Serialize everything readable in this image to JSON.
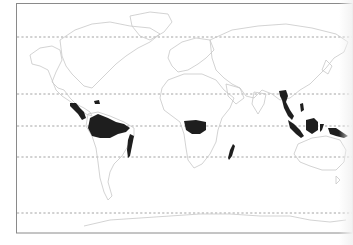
{
  "map": {
    "type": "world-outline",
    "projection": "equirectangular-like",
    "subject": "tropical rainforest distribution",
    "frame": {
      "x": 16,
      "y": 3,
      "width": 336,
      "height": 230,
      "stroke": "#8a8a8a"
    },
    "latitude_lines": [
      {
        "name": "arctic-circle",
        "y": 37
      },
      {
        "name": "tropic-of-cancer",
        "y": 94
      },
      {
        "name": "equator",
        "y": 126
      },
      {
        "name": "tropic-of-capricorn",
        "y": 157
      },
      {
        "name": "antarctic-circle",
        "y": 213
      }
    ],
    "colors": {
      "background": "#ffffff",
      "outline": "#c8c8c8",
      "grid": "#9a9a9a",
      "highlight": "#1e1e1e"
    },
    "highlighted_regions": [
      "central-america",
      "amazon-basin",
      "atlantic-forest-brazil",
      "congo-basin",
      "madagascar-east",
      "southeast-asia-mainland",
      "sumatra",
      "borneo",
      "new-guinea"
    ]
  }
}
